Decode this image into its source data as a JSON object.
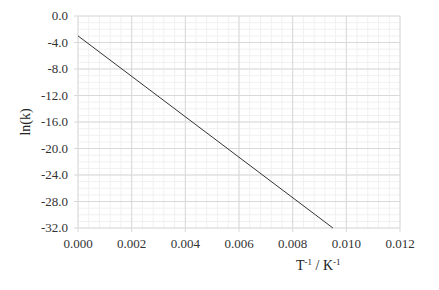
{
  "chart_data": {
    "type": "line",
    "title": "",
    "xlabel": "T-1 / K-1",
    "xlabel_parts": {
      "base1": "T",
      "sup1": "-1",
      "mid": " / K",
      "sup2": "-1"
    },
    "ylabel": "ln(k)",
    "xlim": [
      0.0,
      0.012
    ],
    "ylim": [
      -32.0,
      0.0
    ],
    "x_ticks": [
      "0.000",
      "0.002",
      "0.004",
      "0.006",
      "0.008",
      "0.010",
      "0.012"
    ],
    "x_tick_values": [
      0.0,
      0.002,
      0.004,
      0.006,
      0.008,
      0.01,
      0.012
    ],
    "y_ticks": [
      "0.0",
      "-4.0",
      "-8.0",
      "-12.0",
      "-16.0",
      "-20.0",
      "-24.0",
      "-28.0",
      "-32.0"
    ],
    "y_tick_values": [
      0.0,
      -4.0,
      -8.0,
      -12.0,
      -16.0,
      -20.0,
      -24.0,
      -28.0,
      -32.0
    ],
    "grid": {
      "major": true,
      "minor": true
    },
    "legend": null,
    "series": [
      {
        "name": "ln(k) vs 1/T",
        "color": "#333333",
        "x": [
          0.0,
          0.0095
        ],
        "y": [
          -3.0,
          -32.0
        ]
      }
    ]
  },
  "colors": {
    "major_grid": "#d9d9d9",
    "minor_grid": "#f0f0f0",
    "line": "#333333"
  }
}
